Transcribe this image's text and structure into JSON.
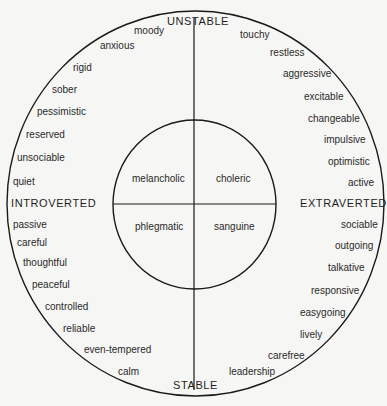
{
  "diagram": {
    "axes": {
      "top": "UNSTABLE",
      "bottom": "STABLE",
      "left": "INTROVERTED",
      "right": "EXTRAVERTED"
    },
    "temperaments": {
      "top_left": "melancholic",
      "top_right": "choleric",
      "bottom_left": "phlegmatic",
      "bottom_right": "sanguine"
    },
    "traits": {
      "unstable_introverted": [
        "moody",
        "anxious",
        "rigid",
        "sober",
        "pessimistic",
        "reserved",
        "unsociable",
        "quiet"
      ],
      "unstable_extraverted": [
        "touchy",
        "restless",
        "aggressive",
        "excitable",
        "changeable",
        "impulsive",
        "optimistic",
        "active"
      ],
      "stable_introverted": [
        "passive",
        "careful",
        "thoughtful",
        "peaceful",
        "controlled",
        "reliable",
        "even-tempered",
        "calm"
      ],
      "stable_extraverted": [
        "sociable",
        "outgoing",
        "talkative",
        "responsive",
        "easygoing",
        "lively",
        "carefree",
        "leadership"
      ]
    },
    "colors": {
      "line": "#1a1a1a",
      "background": "#f6f6f4",
      "text": "#2a2a2a"
    }
  }
}
